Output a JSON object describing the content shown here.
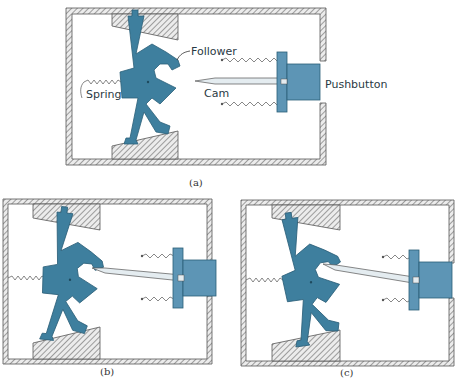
{
  "figure": {
    "panels": [
      {
        "id": "a",
        "caption": "(a)"
      },
      {
        "id": "b",
        "caption": "(b)"
      },
      {
        "id": "c",
        "caption": "(c)"
      }
    ],
    "labels": {
      "follower": "Follower",
      "spring": "Spring",
      "cam": "Cam",
      "pushbutton": "Pushbutton"
    },
    "colors": {
      "follower": "#3e7f9e",
      "pushbutton": "#5d95b5",
      "housing_hatch": "#8a8a8a",
      "cam": "#e4ecf0",
      "spring": "#555555"
    }
  }
}
